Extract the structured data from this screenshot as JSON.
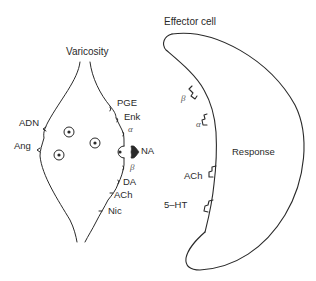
{
  "diagram": {
    "varicosity": {
      "title": "Varicosity",
      "left_receptors": [
        "ADN",
        "Ang"
      ],
      "right_receptors": [
        "PGE",
        "Enk",
        "α",
        "β",
        "DA",
        "ACh",
        "Nic"
      ],
      "release_label": "NA",
      "vesicle_count": 4
    },
    "effector_cell": {
      "title": "Effector cell",
      "receptors": [
        "β",
        "α",
        "ACh",
        "5–HT"
      ],
      "response_label": "Response"
    },
    "colors": {
      "line": "#2a2a2a",
      "text": "#2a2a2a",
      "background": "#ffffff"
    }
  }
}
